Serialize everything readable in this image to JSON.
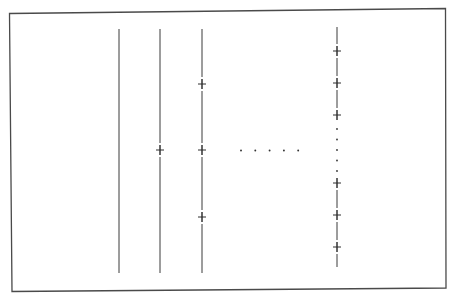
{
  "diagram": {
    "lines": [
      {
        "id": "line-1",
        "markers": 0,
        "ellipsis_marks": false
      },
      {
        "id": "line-2",
        "markers": 1,
        "ellipsis_marks": false
      },
      {
        "id": "line-3",
        "markers": 3,
        "ellipsis_marks": false
      },
      {
        "id": "line-n",
        "markers": 6,
        "ellipsis_marks": true
      }
    ],
    "horizontal_ellipsis_dots": 5,
    "vertical_ellipsis_dots": 5,
    "colors": {
      "stroke": "#3a3a3a",
      "background": "#ffffff"
    }
  }
}
